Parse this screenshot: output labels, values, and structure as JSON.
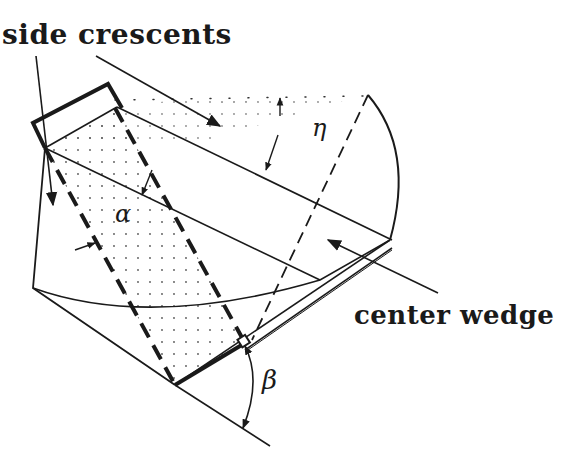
{
  "diagram": {
    "type": "geometric-construction",
    "labels": {
      "side_crescents": "side crescents",
      "center_wedge": "center wedge"
    },
    "angles": {
      "eta": "η",
      "alpha": "α",
      "beta": "β"
    },
    "colors": {
      "ink": "#1a1a1a",
      "background": "#ffffff",
      "stipple": "#555555"
    }
  }
}
